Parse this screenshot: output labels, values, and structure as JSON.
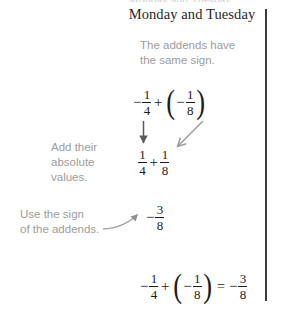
{
  "document": {
    "heading": "Monday and Tuesday",
    "top_cut_text": "Monday and Tuesday",
    "notes": {
      "same_sign": "The addends have\nthe same sign.",
      "same_sign_line1": "The addends have",
      "same_sign_line2": "the same sign.",
      "absolute_values_line1": "Add their",
      "absolute_values_line2": "absolute",
      "absolute_values_line3": "values.",
      "use_sign_line1": "Use the sign",
      "use_sign_line2": "of the addends."
    },
    "expressions": {
      "step1": {
        "label": "negative-one-fourth-plus-negative-one-eighth",
        "sign_a": "−",
        "term_a_num": "1",
        "term_a_den": "4",
        "operator": "+",
        "paren_open": "(",
        "sign_b": "−",
        "term_b_num": "1",
        "term_b_den": "8",
        "paren_close": ")"
      },
      "step2": {
        "label": "one-fourth-plus-one-eighth",
        "term_a_num": "1",
        "term_a_den": "4",
        "operator": "+",
        "term_b_num": "1",
        "term_b_den": "8"
      },
      "step3": {
        "label": "negative-three-eighths",
        "sign": "−",
        "num": "3",
        "den": "8"
      },
      "step4": {
        "label": "full-equation",
        "sign_a": "−",
        "term_a_num": "1",
        "term_a_den": "4",
        "operator": "+",
        "paren_open": "(",
        "sign_b": "−",
        "term_b_num": "1",
        "term_b_den": "8",
        "paren_close": ")",
        "equals": "=",
        "result_sign": "−",
        "result_num": "3",
        "result_den": "8"
      }
    }
  },
  "colors": {
    "text_dark": "#1c1c1c",
    "heading": "#27272a",
    "note_gray": "#9c9c9c",
    "rule": "#3a3a3a",
    "arrow_dark": "#55555a",
    "arrow_gray": "#a0a0a0",
    "background": "#ffffff"
  }
}
